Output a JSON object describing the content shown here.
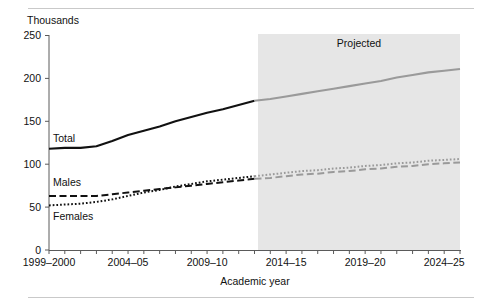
{
  "figure": {
    "units_label": "Thousands",
    "projection_band_label": "Projected"
  },
  "chart_data": {
    "type": "line",
    "title": "",
    "subtitle": "",
    "xlabel": "Academic year",
    "ylabel": "Thousands",
    "ylim": [
      0,
      250
    ],
    "yticks": [
      0,
      50,
      100,
      150,
      200,
      250
    ],
    "ytick_labels": [
      "0",
      "50",
      "100",
      "150",
      "200",
      "250"
    ],
    "grid": false,
    "legend_position": "inline-labels",
    "x": [
      "1999-2000",
      "2000-01",
      "2001-02",
      "2002-03",
      "2003-04",
      "2004-05",
      "2005-06",
      "2006-07",
      "2007-08",
      "2008-09",
      "2009-10",
      "2010-11",
      "2011-12",
      "2012-13",
      "2013-14",
      "2014-15",
      "2015-16",
      "2016-17",
      "2017-18",
      "2018-19",
      "2019-20",
      "2020-21",
      "2021-22",
      "2022-23",
      "2023-24",
      "2024-25",
      "2025-26"
    ],
    "xtick_labels_shown": [
      "1999–2000",
      "2004–05",
      "2009–10",
      "2014–15",
      "2019–20",
      "2024–25"
    ],
    "xtick_label_indices": [
      0,
      5,
      10,
      15,
      20,
      25
    ],
    "projection_starts_at": "2012-13",
    "projection_start_index": 13,
    "series": [
      {
        "name": "Total",
        "style": "solid",
        "color": "#111111",
        "projected_color": "#9a9a9a",
        "values": [
          118,
          119,
          119,
          121,
          127,
          134,
          139,
          144,
          150,
          155,
          160,
          164,
          169,
          174,
          176,
          179,
          182,
          185,
          188,
          191,
          194,
          197,
          201,
          204,
          207,
          209,
          211
        ]
      },
      {
        "name": "Males",
        "style": "dashed",
        "color": "#111111",
        "projected_color": "#9a9a9a",
        "values": [
          63,
          63,
          63,
          63,
          65,
          67,
          69,
          71,
          73,
          75,
          77,
          79,
          81,
          83,
          84,
          86,
          88,
          89,
          91,
          92,
          94,
          95,
          97,
          98,
          100,
          101,
          102
        ]
      },
      {
        "name": "Females",
        "style": "dotted",
        "color": "#111111",
        "projected_color": "#9a9a9a",
        "values": [
          52,
          53,
          54,
          56,
          59,
          63,
          67,
          70,
          74,
          77,
          80,
          82,
          84,
          86,
          88,
          90,
          92,
          93,
          95,
          96,
          98,
          99,
          101,
          102,
          104,
          105,
          106
        ]
      }
    ]
  }
}
